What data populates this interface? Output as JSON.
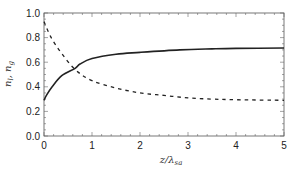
{
  "chart_data": {
    "type": "line",
    "title": "",
    "xlabel": "z/λ_sa",
    "xlabel_main": "z/λ",
    "xlabel_sub": "sa",
    "ylabel": "n_l, n_g",
    "ylabel_parts": {
      "a": "n",
      "a_sub": "l",
      "sep": ", ",
      "b": "n",
      "b_sub": "g"
    },
    "xlim": [
      0,
      5
    ],
    "ylim": [
      0.0,
      1.0
    ],
    "xticks": [
      "0",
      "1",
      "2",
      "3",
      "4",
      "5"
    ],
    "yticks": [
      "0.0",
      "0.2",
      "0.4",
      "0.6",
      "0.8",
      "1.0"
    ],
    "grid": false,
    "legend": null,
    "series": [
      {
        "name": "solid",
        "style": "solid",
        "color": "#222222",
        "x": [
          0,
          0.05,
          0.17,
          0.37,
          0.65,
          0.75,
          1.0,
          1.5,
          2.0,
          2.83,
          3.5,
          4.0,
          5.0
        ],
        "y": [
          0.29,
          0.33,
          0.4,
          0.49,
          0.55,
          0.585,
          0.63,
          0.665,
          0.68,
          0.7,
          0.708,
          0.712,
          0.715
        ]
      },
      {
        "name": "dashed",
        "style": "dashed",
        "color": "#222222",
        "x": [
          0,
          0.15,
          0.37,
          0.65,
          1.0,
          1.5,
          2.0,
          2.5,
          3.0,
          3.5,
          4.0,
          5.0
        ],
        "y": [
          0.93,
          0.8,
          0.67,
          0.54,
          0.45,
          0.39,
          0.35,
          0.33,
          0.31,
          0.3,
          0.295,
          0.29
        ]
      }
    ]
  }
}
